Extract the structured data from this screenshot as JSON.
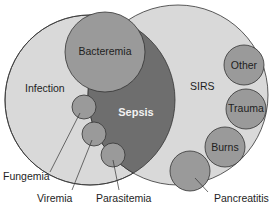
{
  "diagram": {
    "type": "venn",
    "colors": {
      "light_fill": "#d9d9d9",
      "sepsis_fill": "#6e6e6e",
      "bubble_fill": "#9a9a9a",
      "stroke": "#333333",
      "text_dark": "#1e1e1e",
      "text_light": "#f2f2f2"
    },
    "sets": {
      "infection": {
        "label": "Infection"
      },
      "sirs": {
        "label": "SIRS"
      },
      "sepsis": {
        "label": "Sepsis"
      }
    },
    "infection_subsets": [
      {
        "id": "bacteremia",
        "label": "Bacteremia"
      },
      {
        "id": "fungemia",
        "label": "Fungemia"
      },
      {
        "id": "viremia",
        "label": "Viremia"
      },
      {
        "id": "parasitemia",
        "label": "Parasitemia"
      }
    ],
    "sirs_causes": [
      {
        "id": "other",
        "label": "Other"
      },
      {
        "id": "trauma",
        "label": "Trauma"
      },
      {
        "id": "burns",
        "label": "Burns"
      },
      {
        "id": "pancreatitis",
        "label": "Pancreatitis"
      }
    ]
  }
}
